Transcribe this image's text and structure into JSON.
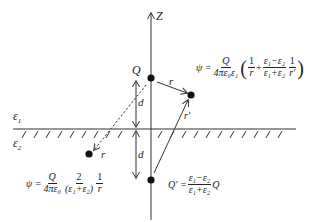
{
  "diagram": {
    "axis_label": "Z",
    "charge_label": "Q",
    "image_charge_label": "Q′",
    "distance_label_top": "d",
    "distance_label_bottom": "d",
    "r_label_upper": "r",
    "r_prime_label": "r′",
    "r_label_lower": "r",
    "medium_1_label": "ε",
    "medium_1_sub": "1",
    "medium_2_label": "ε",
    "medium_2_sub": "2",
    "formula_upper": {
      "lhs": "ψ =",
      "coef_num": "Q",
      "coef_den": "4πε₀ε₁",
      "open": "(",
      "t1_num": "1",
      "t1_den": "r",
      "plus": "+",
      "t2_num": "ε₁−ε₂",
      "t2_den": "ε₁+ε₂",
      "t3_num": "1",
      "t3_den": "r′",
      "close": ")"
    },
    "formula_lower": {
      "lhs": "ψ =",
      "coef_num": "Q",
      "coef_den": "4πε₀",
      "t1_num": "2",
      "t1_den": "(ε₁+ε₂)",
      "t2_num": "1",
      "t2_den": "r"
    },
    "formula_image": {
      "lhs": "Q′ =",
      "frac_num": "ε₁−ε₂",
      "frac_den": "ε₁+ε₂",
      "rhs": "Q"
    },
    "colors": {
      "line": "#333333",
      "point": "#111111"
    }
  }
}
